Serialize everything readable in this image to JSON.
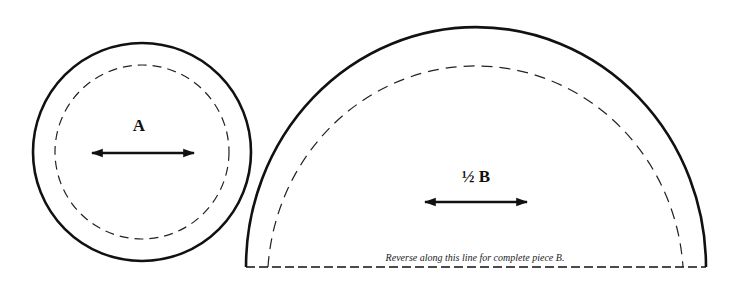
{
  "diagram": {
    "colors": {
      "stroke": "#111111",
      "background": "#ffffff"
    },
    "pieces": [
      {
        "id": "A",
        "shape": "circle",
        "label": "A",
        "cut_line": "solid",
        "seam_line": "dashed",
        "grain_arrow": "horizontal double-headed"
      },
      {
        "id": "B",
        "shape": "half-circle",
        "label": "½ B",
        "cut_line": "solid",
        "seam_line": "dashed",
        "grain_arrow": "horizontal double-headed",
        "fold_note": "Reverse along this line for complete piece B."
      }
    ]
  }
}
